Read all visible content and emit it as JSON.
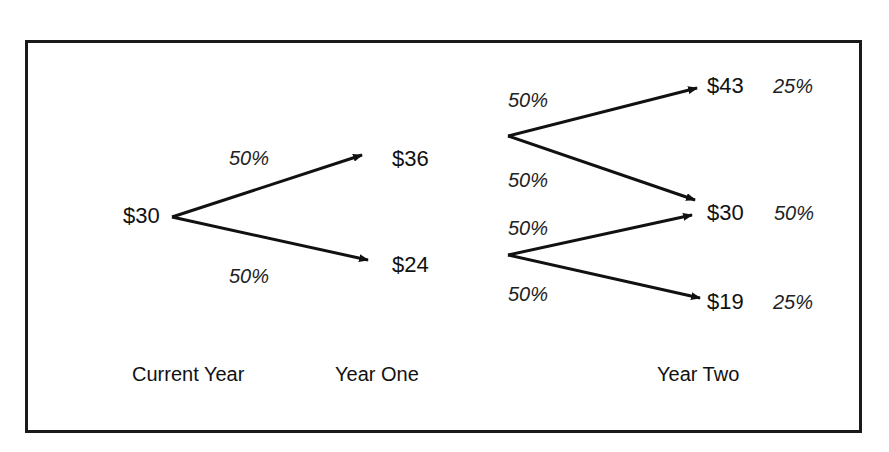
{
  "diagram": {
    "type": "binomial-price-tree",
    "periods": [
      {
        "label": "Current Year"
      },
      {
        "label": "Year One"
      },
      {
        "label": "Year Two"
      }
    ],
    "nodes": {
      "current": {
        "value": "$30"
      },
      "year_one": [
        {
          "value": "$36"
        },
        {
          "value": "$24"
        }
      ],
      "year_two": [
        {
          "value": "$43",
          "probability": "25%"
        },
        {
          "value": "$30",
          "probability": "50%"
        },
        {
          "value": "$19",
          "probability": "25%"
        }
      ]
    },
    "branches": {
      "current_up": "50%",
      "current_down": "50%",
      "y1_high_up": "50%",
      "y1_high_down": "50%",
      "y1_low_up": "50%",
      "y1_low_down": "50%"
    }
  }
}
